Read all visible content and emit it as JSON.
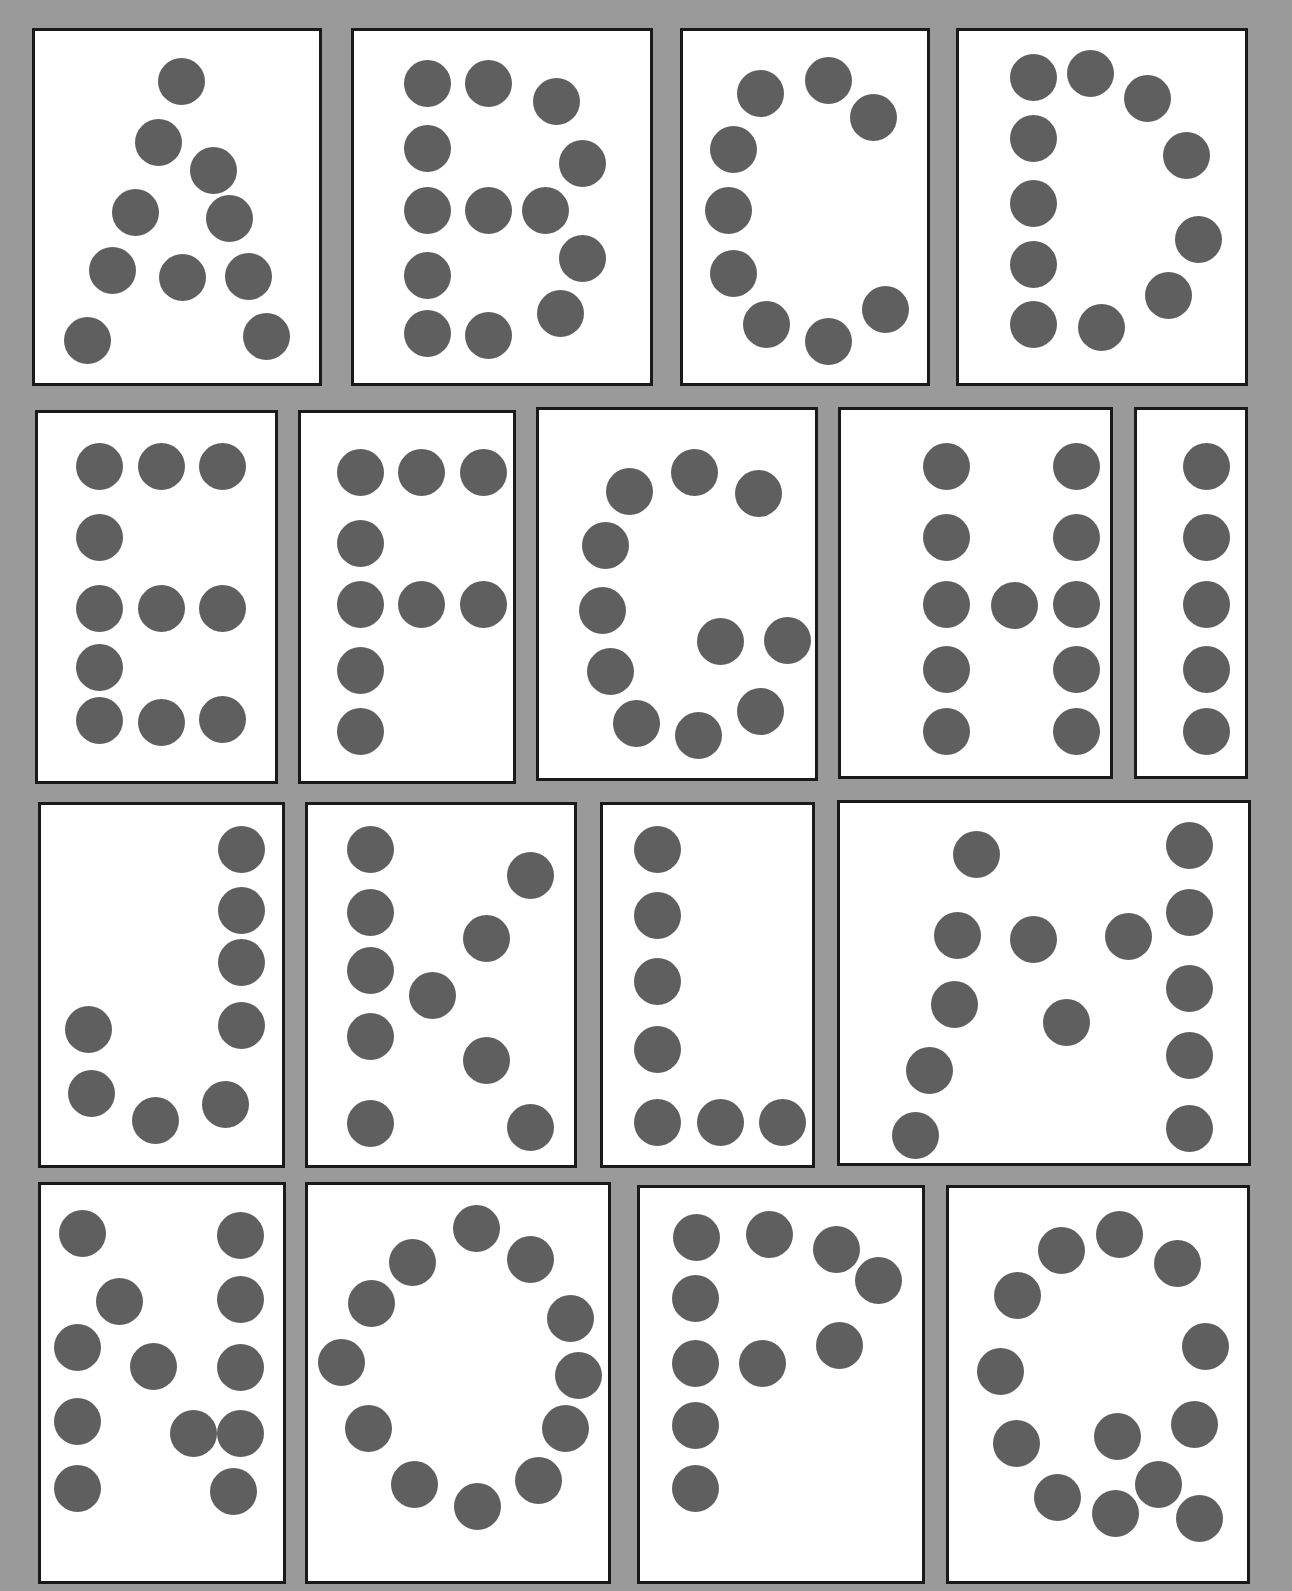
{
  "colors": {
    "background": "#9a9a9a",
    "card": "#ffffff",
    "border": "#1a1a1a",
    "dot": "#5f5f5f"
  },
  "cards": [
    {
      "letter": "A",
      "box": [
        32,
        28,
        290,
        358
      ],
      "dots": [
        [
          181,
          81
        ],
        [
          158,
          142
        ],
        [
          213,
          170
        ],
        [
          135,
          212
        ],
        [
          229,
          218
        ],
        [
          112,
          270
        ],
        [
          182,
          277
        ],
        [
          248,
          276
        ],
        [
          87,
          340
        ],
        [
          266,
          336
        ]
      ]
    },
    {
      "letter": "B",
      "box": [
        351,
        28,
        302,
        358
      ],
      "dots": [
        [
          427,
          83
        ],
        [
          488,
          83
        ],
        [
          556,
          101
        ],
        [
          427,
          148
        ],
        [
          582,
          163
        ],
        [
          427,
          210
        ],
        [
          488,
          210
        ],
        [
          545,
          210
        ],
        [
          427,
          275
        ],
        [
          582,
          258
        ],
        [
          427,
          333
        ],
        [
          488,
          335
        ],
        [
          560,
          313
        ]
      ]
    },
    {
      "letter": "C",
      "box": [
        680,
        28,
        250,
        358
      ],
      "dots": [
        [
          760,
          93
        ],
        [
          828,
          80
        ],
        [
          873,
          117
        ],
        [
          733,
          149
        ],
        [
          728,
          210
        ],
        [
          733,
          273
        ],
        [
          766,
          324
        ],
        [
          828,
          341
        ],
        [
          885,
          309
        ]
      ]
    },
    {
      "letter": "D",
      "box": [
        956,
        28,
        292,
        358
      ],
      "dots": [
        [
          1033,
          77
        ],
        [
          1090,
          73
        ],
        [
          1147,
          98
        ],
        [
          1186,
          155
        ],
        [
          1033,
          138
        ],
        [
          1033,
          203
        ],
        [
          1198,
          239
        ],
        [
          1033,
          264
        ],
        [
          1168,
          295
        ],
        [
          1033,
          324
        ],
        [
          1101,
          327
        ]
      ]
    },
    {
      "letter": "E",
      "box": [
        35,
        410,
        243,
        374
      ],
      "dots": [
        [
          99,
          466
        ],
        [
          161,
          466
        ],
        [
          222,
          466
        ],
        [
          99,
          537
        ],
        [
          99,
          608
        ],
        [
          161,
          608
        ],
        [
          222,
          608
        ],
        [
          99,
          667
        ],
        [
          99,
          720
        ],
        [
          161,
          722
        ],
        [
          222,
          719
        ]
      ]
    },
    {
      "letter": "F",
      "box": [
        298,
        410,
        218,
        374
      ],
      "dots": [
        [
          360,
          472
        ],
        [
          421,
          472
        ],
        [
          483,
          472
        ],
        [
          360,
          543
        ],
        [
          360,
          604
        ],
        [
          421,
          604
        ],
        [
          483,
          604
        ],
        [
          360,
          670
        ],
        [
          360,
          731
        ]
      ]
    },
    {
      "letter": "G",
      "box": [
        536,
        407,
        282,
        374
      ],
      "dots": [
        [
          629,
          491
        ],
        [
          694,
          472
        ],
        [
          758,
          493
        ],
        [
          605,
          545
        ],
        [
          602,
          610
        ],
        [
          720,
          641
        ],
        [
          787,
          640
        ],
        [
          610,
          671
        ],
        [
          636,
          723
        ],
        [
          698,
          735
        ],
        [
          760,
          711
        ]
      ]
    },
    {
      "letter": "H",
      "box": [
        838,
        407,
        275,
        372
      ],
      "dots": [
        [
          946,
          466
        ],
        [
          1076,
          466
        ],
        [
          946,
          537
        ],
        [
          1076,
          537
        ],
        [
          946,
          604
        ],
        [
          1014,
          605
        ],
        [
          1076,
          604
        ],
        [
          946,
          669
        ],
        [
          1076,
          669
        ],
        [
          946,
          731
        ],
        [
          1076,
          731
        ]
      ]
    },
    {
      "letter": "I",
      "box": [
        1134,
        407,
        114,
        372
      ],
      "dots": [
        [
          1206,
          466
        ],
        [
          1206,
          537
        ],
        [
          1206,
          604
        ],
        [
          1206,
          669
        ],
        [
          1206,
          731
        ]
      ]
    },
    {
      "letter": "J",
      "box": [
        38,
        802,
        247,
        366
      ],
      "dots": [
        [
          241,
          849
        ],
        [
          241,
          910
        ],
        [
          241,
          962
        ],
        [
          241,
          1025
        ],
        [
          88,
          1029
        ],
        [
          91,
          1093
        ],
        [
          155,
          1120
        ],
        [
          225,
          1104
        ]
      ]
    },
    {
      "letter": "K",
      "box": [
        305,
        802,
        272,
        366
      ],
      "dots": [
        [
          370,
          849
        ],
        [
          530,
          875
        ],
        [
          370,
          912
        ],
        [
          486,
          938
        ],
        [
          370,
          970
        ],
        [
          432,
          995
        ],
        [
          370,
          1036
        ],
        [
          486,
          1060
        ],
        [
          370,
          1123
        ],
        [
          530,
          1127
        ]
      ]
    },
    {
      "letter": "L",
      "box": [
        600,
        802,
        215,
        366
      ],
      "dots": [
        [
          657,
          849
        ],
        [
          657,
          915
        ],
        [
          657,
          981
        ],
        [
          657,
          1049
        ],
        [
          657,
          1122
        ],
        [
          720,
          1122
        ],
        [
          782,
          1122
        ]
      ]
    },
    {
      "letter": "M",
      "box": [
        837,
        800,
        414,
        366
      ],
      "dots": [
        [
          976,
          854
        ],
        [
          1189,
          845
        ],
        [
          957,
          935
        ],
        [
          1033,
          939
        ],
        [
          1128,
          936
        ],
        [
          1189,
          912
        ],
        [
          954,
          1004
        ],
        [
          1066,
          1022
        ],
        [
          1189,
          988
        ],
        [
          929,
          1070
        ],
        [
          1189,
          1055
        ],
        [
          915,
          1135
        ],
        [
          1189,
          1128
        ]
      ]
    },
    {
      "letter": "N",
      "box": [
        38,
        1182,
        248,
        402
      ],
      "dots": [
        [
          82,
          1233
        ],
        [
          240,
          1235
        ],
        [
          119,
          1301
        ],
        [
          240,
          1299
        ],
        [
          77,
          1347
        ],
        [
          153,
          1366
        ],
        [
          240,
          1367
        ],
        [
          77,
          1421
        ],
        [
          193,
          1433
        ],
        [
          240,
          1433
        ],
        [
          77,
          1488
        ],
        [
          233,
          1491
        ]
      ]
    },
    {
      "letter": "O",
      "box": [
        305,
        1182,
        306,
        402
      ],
      "dots": [
        [
          476,
          1228
        ],
        [
          412,
          1262
        ],
        [
          530,
          1259
        ],
        [
          371,
          1303
        ],
        [
          570,
          1318
        ],
        [
          341,
          1362
        ],
        [
          578,
          1375
        ],
        [
          368,
          1428
        ],
        [
          565,
          1428
        ],
        [
          414,
          1484
        ],
        [
          477,
          1506
        ],
        [
          538,
          1480
        ]
      ]
    },
    {
      "letter": "P",
      "box": [
        637,
        1185,
        288,
        399
      ],
      "dots": [
        [
          696,
          1237
        ],
        [
          769,
          1234
        ],
        [
          836,
          1249
        ],
        [
          695,
          1298
        ],
        [
          878,
          1280
        ],
        [
          695,
          1363
        ],
        [
          762,
          1363
        ],
        [
          839,
          1345
        ],
        [
          695,
          1425
        ],
        [
          695,
          1488
        ]
      ]
    },
    {
      "letter": "Q",
      "box": [
        946,
        1185,
        304,
        399
      ],
      "dots": [
        [
          1061,
          1250
        ],
        [
          1119,
          1234
        ],
        [
          1177,
          1263
        ],
        [
          1017,
          1295
        ],
        [
          1205,
          1346
        ],
        [
          1000,
          1371
        ],
        [
          1016,
          1443
        ],
        [
          1194,
          1424
        ],
        [
          1117,
          1436
        ],
        [
          1057,
          1497
        ],
        [
          1158,
          1484
        ],
        [
          1115,
          1513
        ],
        [
          1199,
          1518
        ]
      ]
    }
  ]
}
